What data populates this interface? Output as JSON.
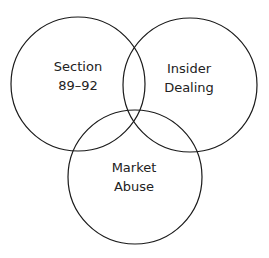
{
  "diagram": {
    "type": "venn",
    "sets": [
      {
        "id": "section-89-92",
        "label_lines": [
          "Section",
          "89–92"
        ],
        "circle": {
          "cx": 78,
          "cy": 84,
          "r": 67
        },
        "label_pos": {
          "x": 78,
          "y1": 71,
          "y2": 90
        }
      },
      {
        "id": "insider-dealing",
        "label_lines": [
          "Insider",
          "Dealing"
        ],
        "circle": {
          "cx": 190,
          "cy": 85,
          "r": 67
        },
        "label_pos": {
          "x": 189,
          "y1": 73,
          "y2": 92
        }
      },
      {
        "id": "market-abuse",
        "label_lines": [
          "Market",
          "Abuse"
        ],
        "circle": {
          "cx": 135,
          "cy": 177,
          "r": 67
        },
        "label_pos": {
          "x": 134,
          "y1": 172,
          "y2": 191
        }
      }
    ],
    "stroke_color": "#1a1a1a",
    "text_color": "#222222",
    "background": "#ffffff"
  }
}
